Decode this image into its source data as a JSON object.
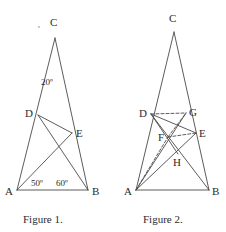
{
  "canvas": {
    "width": 226,
    "height": 232,
    "background": "#ffffff"
  },
  "style": {
    "stroke_color": "#4a4a4a",
    "stroke_width": 0.9,
    "dash_pattern": "3,2",
    "text_color": "#2b2b2b"
  },
  "figures": [
    {
      "id": "figure-1",
      "caption": "Figure 1.",
      "caption_pos": {
        "x": 23,
        "y": 214
      },
      "points": {
        "A": {
          "x": 17,
          "y": 190,
          "label": "A",
          "label_x": 5,
          "label_y": 186
        },
        "B": {
          "x": 88,
          "y": 190,
          "label": "B",
          "label_x": 92,
          "label_y": 186
        },
        "C": {
          "x": 55,
          "y": 38,
          "label": "C",
          "label_x": 50,
          "label_y": 17
        },
        "D": {
          "x": 38,
          "y": 115,
          "label": "D",
          "label_x": 25,
          "label_y": 108
        },
        "E": {
          "x": 72,
          "y": 133,
          "label": "E",
          "label_x": 76,
          "label_y": 128
        }
      },
      "segments": [
        {
          "name": "side-AC",
          "from": "A",
          "to": "C",
          "dashed": false
        },
        {
          "name": "side-BC",
          "from": "B",
          "to": "C",
          "dashed": false
        },
        {
          "name": "side-AB",
          "from": "A",
          "to": "B",
          "dashed": false
        },
        {
          "name": "segment-DE",
          "from": "D",
          "to": "E",
          "dashed": false
        },
        {
          "name": "segment-DB",
          "from": "D",
          "to": "B",
          "dashed": false
        },
        {
          "name": "segment-AE",
          "from": "A",
          "to": "E",
          "dashed": false
        }
      ],
      "angles": [
        {
          "name": "angle-at-C",
          "text": "20º",
          "x": 41,
          "y": 78
        },
        {
          "name": "angle-DAB",
          "text": "50º",
          "x": 31,
          "y": 179
        },
        {
          "name": "angle-EBA",
          "text": "60º",
          "x": 56,
          "y": 179
        }
      ]
    },
    {
      "id": "figure-2",
      "caption": "Figure 2.",
      "caption_pos": {
        "x": 143,
        "y": 214
      },
      "points": {
        "A": {
          "x": 136,
          "y": 190,
          "label": "A",
          "label_x": 124,
          "label_y": 186
        },
        "B": {
          "x": 209,
          "y": 190,
          "label": "B",
          "label_x": 212,
          "label_y": 186
        },
        "C": {
          "x": 174,
          "y": 32,
          "label": "C",
          "label_x": 169,
          "label_y": 13
        },
        "D": {
          "x": 151,
          "y": 114,
          "label": "D",
          "label_x": 139,
          "label_y": 108
        },
        "G": {
          "x": 186,
          "y": 113,
          "label": "G",
          "label_x": 189,
          "label_y": 107
        },
        "E": {
          "x": 196,
          "y": 133,
          "label": "E",
          "label_x": 199,
          "label_y": 128
        },
        "F": {
          "x": 168,
          "y": 137,
          "label": "F",
          "label_x": 158,
          "label_y": 132
        },
        "H": {
          "x": 178,
          "y": 154,
          "label": "H",
          "label_x": 173,
          "label_y": 157
        }
      },
      "segments": [
        {
          "name": "side-AC",
          "from": "A",
          "to": "C",
          "dashed": false
        },
        {
          "name": "side-BC",
          "from": "B",
          "to": "C",
          "dashed": false
        },
        {
          "name": "side-AB",
          "from": "A",
          "to": "B",
          "dashed": false
        },
        {
          "name": "segment-DE",
          "from": "D",
          "to": "E",
          "dashed": false
        },
        {
          "name": "segment-DB",
          "from": "D",
          "to": "B",
          "dashed": false
        },
        {
          "name": "segment-AE",
          "from": "A",
          "to": "E",
          "dashed": false
        },
        {
          "name": "segment-AG",
          "from": "A",
          "to": "G",
          "dashed": false
        },
        {
          "name": "segment-DG",
          "from": "D",
          "to": "G",
          "dashed": true
        },
        {
          "name": "segment-DH",
          "from": "D",
          "to": "H",
          "dashed": false
        },
        {
          "name": "segment-AF",
          "from": "A",
          "to": "F",
          "dashed": true
        },
        {
          "name": "segment-FE",
          "from": "F",
          "to": "E",
          "dashed": true
        },
        {
          "name": "segment-FG",
          "from": "F",
          "to": "G",
          "dashed": true
        }
      ],
      "angles": []
    }
  ]
}
